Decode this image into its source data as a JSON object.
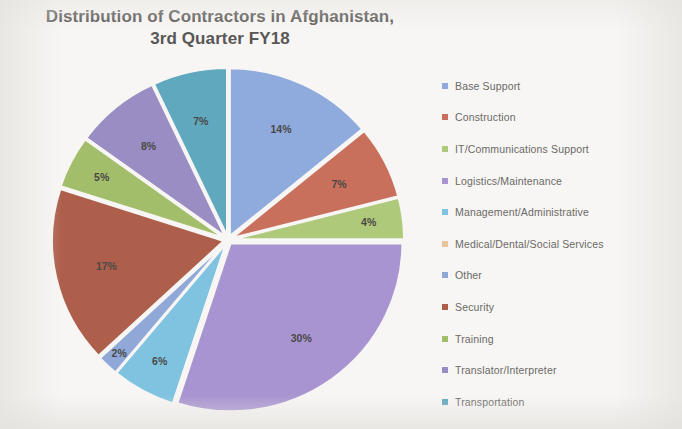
{
  "chart_data": {
    "type": "pie",
    "title": "Distribution of Contractors in Afghanistan, 3rd Quarter FY18",
    "title_line1": "Distribution of Contractors in Afghanistan,",
    "title_line2": "3rd Quarter FY18",
    "xlabel": "",
    "ylabel": "",
    "legend_position": "right",
    "grid": false,
    "units": "percent",
    "categories": [
      "Base Support",
      "Construction",
      "IT/Communications Support",
      "Logistics/Maintenance",
      "Management/Administrative",
      "Medical/Dental/Social Services",
      "Other",
      "Security",
      "Training",
      "Translator/Interpreter",
      "Transportation"
    ],
    "values": [
      14,
      7,
      4,
      30,
      6,
      0,
      2,
      17,
      5,
      8,
      7
    ],
    "labels": [
      "14%",
      "7%",
      "4%",
      "30%",
      "6%",
      "0%",
      "2%",
      "17%",
      "5%",
      "8%",
      "7%"
    ],
    "colors": [
      "#8FAADC",
      "#C9705C",
      "#AFC97A",
      "#A894D0",
      "#7FC3E0",
      "#E8C49A",
      "#8FA8D8",
      "#AE5F4C",
      "#A3BE6B",
      "#9A8DC4",
      "#5FA8BE"
    ],
    "start_angle_deg": 0,
    "direction": "clockwise"
  },
  "legend": {
    "items": [
      {
        "label": "Base Support",
        "color": "#8FAADC",
        "value": 14
      },
      {
        "label": "Construction",
        "color": "#C9705C",
        "value": 7
      },
      {
        "label": "IT/Communications Support",
        "color": "#AFC97A",
        "value": 4
      },
      {
        "label": "Logistics/Maintenance",
        "color": "#A894D0",
        "value": 30
      },
      {
        "label": "Management/Administrative",
        "color": "#7FC3E0",
        "value": 6
      },
      {
        "label": "Medical/Dental/Social Services",
        "color": "#E8C49A",
        "value": 0
      },
      {
        "label": "Other",
        "color": "#8FA8D8",
        "value": 2
      },
      {
        "label": "Security",
        "color": "#AE5F4C",
        "value": 17
      },
      {
        "label": "Training",
        "color": "#A3BE6B",
        "value": 5
      },
      {
        "label": "Translator/Interpreter",
        "color": "#9A8DC4",
        "value": 8
      },
      {
        "label": "Transportation",
        "color": "#5FA8BE",
        "value": 7
      }
    ]
  }
}
